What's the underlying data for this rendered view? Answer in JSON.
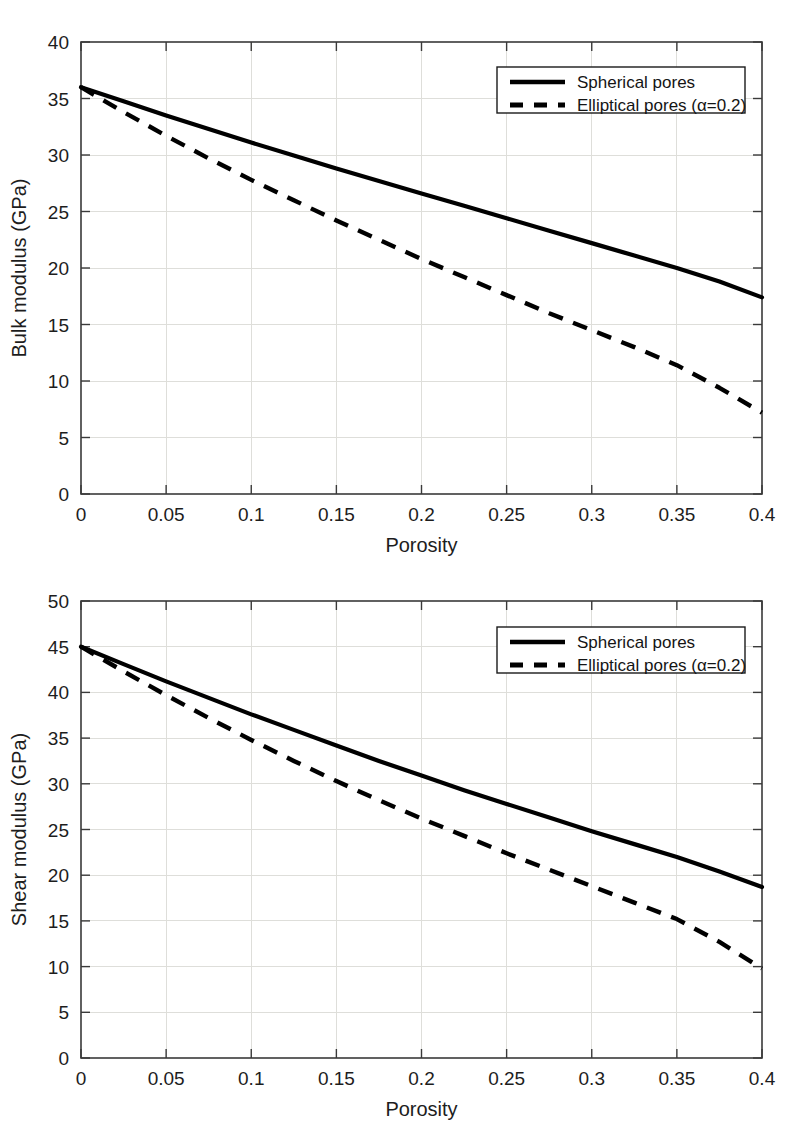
{
  "figures": [
    {
      "id": "bulk-modulus",
      "chart_data": {
        "type": "line",
        "title": "",
        "xlabel": "Porosity",
        "ylabel": "Bulk modulus (GPa)",
        "xlim": [
          0,
          0.4
        ],
        "ylim": [
          0,
          40
        ],
        "grid": true,
        "legend_position": "top-right",
        "xticks": [
          0,
          0.05,
          0.1,
          0.15,
          0.2,
          0.25,
          0.3,
          0.35,
          0.4
        ],
        "xticklabels": [
          "0",
          "0.05",
          "0.1",
          "0.15",
          "0.2",
          "0.25",
          "0.3",
          "0.35",
          "0.4"
        ],
        "yticks": [
          0,
          5,
          10,
          15,
          20,
          25,
          30,
          35,
          40
        ],
        "yticklabels": [
          "0",
          "5",
          "10",
          "15",
          "20",
          "25",
          "30",
          "35",
          "40"
        ],
        "x": [
          0,
          0.025,
          0.05,
          0.075,
          0.1,
          0.125,
          0.15,
          0.175,
          0.2,
          0.225,
          0.25,
          0.275,
          0.3,
          0.325,
          0.35,
          0.375,
          0.4
        ],
        "series": [
          {
            "name": "Spherical pores",
            "style": "solid",
            "values": [
              36.0,
              34.75,
              33.5,
              32.3,
              31.1,
              29.95,
              28.8,
              27.7,
              26.6,
              25.5,
              24.4,
              23.3,
              22.2,
              21.1,
              20.0,
              18.8,
              17.4
            ]
          },
          {
            "name": "Elliptical pores (α=0.2)",
            "style": "dashed",
            "values": [
              36.0,
              33.8,
              31.7,
              29.7,
              27.8,
              26.0,
              24.2,
              22.5,
              20.8,
              19.2,
              17.6,
              16.0,
              14.5,
              13.0,
              11.4,
              9.4,
              7.2
            ]
          }
        ]
      }
    },
    {
      "id": "shear-modulus",
      "chart_data": {
        "type": "line",
        "title": "",
        "xlabel": "Porosity",
        "ylabel": "Shear modulus (GPa)",
        "xlim": [
          0,
          0.4
        ],
        "ylim": [
          0,
          50
        ],
        "grid": true,
        "legend_position": "top-right",
        "xticks": [
          0,
          0.05,
          0.1,
          0.15,
          0.2,
          0.25,
          0.3,
          0.35,
          0.4
        ],
        "xticklabels": [
          "0",
          "0.05",
          "0.1",
          "0.15",
          "0.2",
          "0.25",
          "0.3",
          "0.35",
          "0.4"
        ],
        "yticks": [
          0,
          5,
          10,
          15,
          20,
          25,
          30,
          35,
          40,
          45,
          50
        ],
        "yticklabels": [
          "0",
          "5",
          "10",
          "15",
          "20",
          "25",
          "30",
          "35",
          "40",
          "45",
          "50"
        ],
        "x": [
          0,
          0.025,
          0.05,
          0.075,
          0.1,
          0.125,
          0.15,
          0.175,
          0.2,
          0.225,
          0.25,
          0.275,
          0.3,
          0.325,
          0.35,
          0.375,
          0.4
        ],
        "series": [
          {
            "name": "Spherical pores",
            "style": "solid",
            "values": [
              45.0,
              43.1,
              41.2,
              39.4,
              37.6,
              35.9,
              34.2,
              32.5,
              30.9,
              29.3,
              27.8,
              26.3,
              24.8,
              23.4,
              22.0,
              20.4,
              18.7
            ]
          },
          {
            "name": "Elliptical pores (α=0.2)",
            "style": "dashed",
            "values": [
              45.0,
              42.3,
              39.7,
              37.2,
              34.8,
              32.5,
              30.3,
              28.2,
              26.2,
              24.3,
              22.4,
              20.6,
              18.8,
              17.0,
              15.2,
              12.7,
              9.8
            ]
          }
        ]
      }
    }
  ]
}
